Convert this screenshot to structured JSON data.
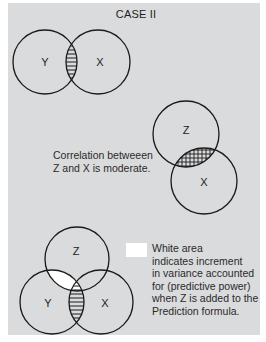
{
  "title": "CASE II",
  "colors": {
    "background": "#dadbdd",
    "stroke": "#1a1a1a",
    "highlight": "#ffffff"
  },
  "diagram_top": {
    "description": "Two overlapping circles Y and X with horizontally hatched overlap",
    "circles": [
      {
        "label": "Y"
      },
      {
        "label": "X"
      }
    ],
    "overlap_pattern": "horizontal-hatch"
  },
  "diagram_middle": {
    "description": "Two overlapping circles Z (above) and X (below) with cross-hatched overlap",
    "circles": [
      {
        "label": "Z"
      },
      {
        "label": "X"
      }
    ],
    "overlap_pattern": "cross-hatch",
    "caption_lines": [
      "Correlation betweeen",
      "Z and X is moderate."
    ]
  },
  "diagram_bottom": {
    "description": "Three circles Z (top), Y (bottom-left), X (bottom-right); Y–X overlap horizontally hatched, Z–Y overlap white",
    "circles": [
      {
        "label": "Z"
      },
      {
        "label": "Y"
      },
      {
        "label": "X"
      }
    ],
    "legend": {
      "swatch": "white",
      "caption_lines": [
        "White area",
        "indicates increment",
        "in variance accounted",
        "for (predictive power)",
        "when Z is added to the",
        "Prediction formula."
      ]
    }
  }
}
